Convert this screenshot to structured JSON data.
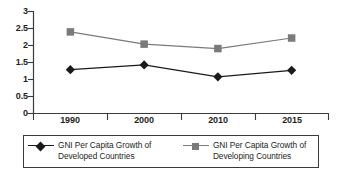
{
  "chart_data": {
    "type": "line",
    "title": "",
    "subtitle": "",
    "xlabel": "",
    "ylabel": "",
    "categories": [
      "1990",
      "2000",
      "2010",
      "2015"
    ],
    "ylim": [
      0,
      3
    ],
    "y_ticks": [
      "0",
      "0.5",
      "1",
      "1.5",
      "2",
      "2.5",
      "3"
    ],
    "y_tick_values": [
      0,
      0.5,
      1,
      1.5,
      2,
      2.5,
      3
    ],
    "grid": false,
    "legend_position": "bottom",
    "series": [
      {
        "name": "GNI Per Capita Growth of Developed Countries",
        "name_line1": "GNI Per Capita Growth of",
        "name_line2": "Developed Countries",
        "marker": "diamond",
        "color": "#1a1a1a",
        "values": [
          1.29,
          1.43,
          1.08,
          1.27
        ]
      },
      {
        "name": "GNI Per Capita Growth of Developing Countries",
        "name_line1": "GNI Per Capita Growth of",
        "name_line2": "Developing Countries",
        "marker": "square",
        "color": "#7a7a7a",
        "values": [
          2.4,
          2.04,
          1.91,
          2.22
        ]
      }
    ]
  },
  "axes": {
    "axis_color": "#3b3b3b",
    "label_color": "#231f20"
  },
  "legend": {
    "border_color": "#3b3b3b",
    "entries": [
      {
        "line1": "GNI Per Capita Growth of",
        "line2": "Developed Countries"
      },
      {
        "line1": "GNI Per Capita Growth of",
        "line2": "Developing Countries"
      }
    ]
  }
}
